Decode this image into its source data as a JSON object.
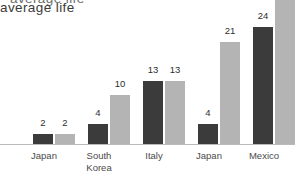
{
  "title": {
    "visible_text": "average life",
    "clipped_above_text": "average life"
  },
  "chart_data": {
    "type": "bar",
    "title": "average life",
    "xlabel": "",
    "ylabel": "",
    "grid": false,
    "legend": "none",
    "ylim": [
      0,
      30
    ],
    "note": "Top of plot is cropped; several bars run past the upper edge of the image and have no visible value label.",
    "categories": [
      "Japan",
      "South Korea",
      "Italy",
      "Japan",
      "Mexico",
      "South Africa",
      "United States"
    ],
    "series": [
      {
        "name": "dark",
        "color": "#3b3b3b",
        "values": [
          2,
          4,
          13,
          4,
          24,
          7,
          null
        ],
        "labels": [
          "2",
          "4",
          "13",
          "4",
          "24",
          "7",
          ""
        ],
        "clipped": [
          false,
          false,
          false,
          false,
          false,
          false,
          true
        ]
      },
      {
        "name": "light",
        "color": "#b4b4b4",
        "values": [
          2,
          10,
          13,
          21,
          null,
          null,
          null
        ],
        "labels": [
          "2",
          "10",
          "13",
          "21",
          "",
          "",
          ""
        ],
        "clipped": [
          false,
          false,
          false,
          false,
          true,
          true,
          true
        ]
      }
    ]
  },
  "bars": [
    {
      "name": "japan-dark",
      "x": 33,
      "w": 20,
      "h": 10,
      "tone": "dark",
      "label": "2",
      "label_x": 33,
      "label_y": 118
    },
    {
      "name": "japan-light",
      "x": 55,
      "w": 20,
      "h": 10,
      "tone": "light",
      "label": "2",
      "label_x": 55,
      "label_y": 118
    },
    {
      "name": "south-korea-dark",
      "x": 88,
      "w": 20,
      "h": 20,
      "tone": "dark",
      "label": "4",
      "label_x": 88,
      "label_y": 108
    },
    {
      "name": "south-korea-light",
      "x": 110,
      "w": 20,
      "h": 49,
      "tone": "light",
      "label": "10",
      "label_x": 110,
      "label_y": 79
    },
    {
      "name": "italy-dark",
      "x": 143,
      "w": 20,
      "h": 63,
      "tone": "dark",
      "label": "13",
      "label_x": 143,
      "label_y": 65
    },
    {
      "name": "italy-light",
      "x": 165,
      "w": 20,
      "h": 63,
      "tone": "light",
      "label": "13",
      "label_x": 165,
      "label_y": 65
    },
    {
      "name": "japan-2-dark",
      "x": 198,
      "w": 20,
      "h": 20,
      "tone": "dark",
      "label": "4",
      "label_x": 198,
      "label_y": 108
    },
    {
      "name": "japan-2-light",
      "x": 220,
      "w": 20,
      "h": 102,
      "tone": "light",
      "label": "21",
      "label_x": 220,
      "label_y": 26
    },
    {
      "name": "mexico-dark",
      "x": 253,
      "w": 20,
      "h": 117,
      "tone": "dark",
      "label": "24",
      "label_x": 253,
      "label_y": 11
    },
    {
      "name": "mexico-light",
      "x": 275,
      "w": 20,
      "h": 152,
      "tone": "light",
      "label": "",
      "label_x": 0,
      "label_y": 0
    },
    {
      "name": "south-africa-dark",
      "x": 308,
      "w": 20,
      "h": 34,
      "tone": "dark",
      "label": "7",
      "label_x": 308,
      "label_y": 94
    },
    {
      "name": "south-africa-light",
      "x": 330,
      "w": 20,
      "h": 152,
      "tone": "light",
      "label": "",
      "label_x": 0,
      "label_y": 0
    },
    {
      "name": "united-states-dark",
      "x": 363,
      "w": 20,
      "h": 152,
      "tone": "dark",
      "label": "",
      "label_x": 0,
      "label_y": 0
    },
    {
      "name": "united-states-light",
      "x": 385,
      "w": 20,
      "h": 152,
      "tone": "light",
      "label": "",
      "label_x": 0,
      "label_y": 0
    }
  ],
  "cat_labels": [
    {
      "name": "japan",
      "text": "Japan",
      "x": 22,
      "w": 44
    },
    {
      "name": "south-korea",
      "text": "South\nKorea",
      "x": 77,
      "w": 44
    },
    {
      "name": "italy",
      "text": "Italy",
      "x": 132,
      "w": 44
    },
    {
      "name": "japan-2",
      "text": "Japan",
      "x": 187,
      "w": 44
    },
    {
      "name": "mexico",
      "text": "Mexico",
      "x": 242,
      "w": 44
    },
    {
      "name": "south-africa",
      "text": "South\nAfrica",
      "x": 297,
      "w": 44
    },
    {
      "name": "united-states",
      "text": "United\nStates",
      "x": 352,
      "w": 44
    }
  ],
  "colors": {
    "dark_bar": "#3b3b3b",
    "light_bar": "#b4b4b4",
    "axis": "#b9b9b9",
    "text": "#4a4a4a",
    "background": "#ffffff"
  }
}
